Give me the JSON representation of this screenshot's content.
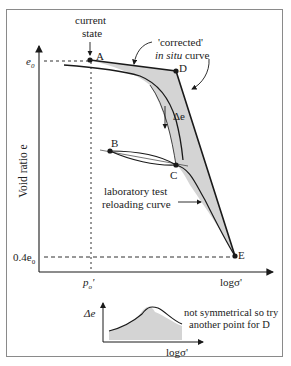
{
  "diagram": {
    "labels": {
      "current_state_line1": "current",
      "current_state_line2": "state",
      "corrected_line1": "'corrected'",
      "corrected_line2_italic": "in situ",
      "corrected_line2_rest": " curve",
      "delta_e": "Δe",
      "lab_line1": "laboratory test",
      "lab_line2": "reloading curve",
      "y_axis": "Void ratio e",
      "x_axis": "logσ'",
      "e0": "e",
      "e0_sub": "0",
      "e04_prefix": "0.4e",
      "e04_sub": "0",
      "p0": "p",
      "p0_sub": "o",
      "p0_prime": "'",
      "note_line1": "not symmetrical so try",
      "note_line2": "another point for D",
      "inset_y": "Δe",
      "inset_x": "logσ'"
    },
    "points": {
      "A": "A",
      "B": "B",
      "C": "C",
      "D": "D",
      "E": "E"
    },
    "colors": {
      "line": "#1a1a1a",
      "fill": "#d4d4d4",
      "frame": "#8a8a8a"
    }
  }
}
